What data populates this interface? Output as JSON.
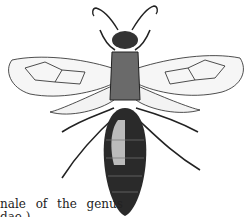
{
  "figure": {
    "style": "engraving, black ink on white"
  },
  "caption": {
    "line1": "nale of the genus",
    "line2": "dae.)"
  }
}
